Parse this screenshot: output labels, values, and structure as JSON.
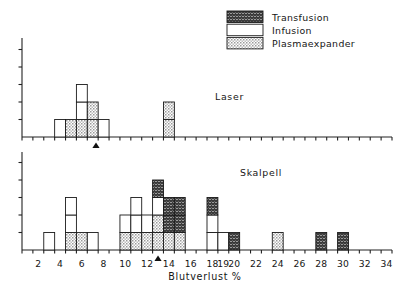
{
  "figure": {
    "xlabel": "Blutverlust %",
    "panels": [
      {
        "key": "laser",
        "label": "Laser"
      },
      {
        "key": "skalpell",
        "label": "Skalpell"
      }
    ]
  },
  "legend": {
    "position": "top-right",
    "items": [
      {
        "key": "transfusion",
        "label": "Transfusion",
        "fill": "#4a4a4a",
        "pattern": "dark-crosshatch"
      },
      {
        "key": "infusion",
        "label": "Infusion",
        "fill": "#ffffff",
        "pattern": "empty"
      },
      {
        "key": "plasmaexpander",
        "label": "Plasmaexpander",
        "fill": "#d8d8d8",
        "pattern": "light-stipple"
      }
    ]
  },
  "colors": {
    "transfusion": "#4a4a4a",
    "infusion": "#ffffff",
    "plasmaexpander": "#d8d8d8",
    "axis": "#222222",
    "outline": "#1a1a1a"
  },
  "axis": {
    "xlim": [
      1,
      35
    ],
    "xticks": [
      2,
      4,
      6,
      8,
      10,
      12,
      14,
      16,
      18,
      19,
      20,
      22,
      24,
      26,
      28,
      30,
      32,
      34
    ],
    "xtick_labels": [
      "2",
      "4",
      "6",
      "8",
      "10",
      "12",
      "14",
      "16",
      "18",
      "19",
      "20",
      "22",
      "24",
      "26",
      "28",
      "30",
      "32",
      "34"
    ],
    "xtick_minor_step": 1,
    "ylim_laser": [
      0,
      5
    ],
    "ylim_skalpell": [
      0,
      5
    ],
    "yticks_unlabeled": true,
    "grid": false
  },
  "chart_data": {
    "type": "bar",
    "title": "",
    "subtitle": "",
    "xlabel": "Blutverlust %",
    "ylabel": "",
    "xlim": [
      1,
      35
    ],
    "ylim": [
      0,
      5
    ],
    "grid": false,
    "legend_position": "top-right",
    "stacked": true,
    "bin_width": 1,
    "categories": [
      "Transfusion",
      "Infusion",
      "Plasmaexpander"
    ],
    "panels": [
      {
        "name": "Laser",
        "mean_marker": 7.8,
        "bins": [
          {
            "x": 4,
            "transfusion": 0,
            "infusion": 1,
            "plasmaexpander": 0
          },
          {
            "x": 5,
            "transfusion": 0,
            "infusion": 0,
            "plasmaexpander": 1
          },
          {
            "x": 6,
            "transfusion": 0,
            "infusion": 2,
            "plasmaexpander": 1
          },
          {
            "x": 7,
            "transfusion": 0,
            "infusion": 0,
            "plasmaexpander": 2
          },
          {
            "x": 8,
            "transfusion": 0,
            "infusion": 1,
            "plasmaexpander": 0
          },
          {
            "x": 14,
            "transfusion": 0,
            "infusion": 0,
            "plasmaexpander": 2
          }
        ]
      },
      {
        "name": "Skalpell",
        "mean_marker": 13.5,
        "bins": [
          {
            "x": 3,
            "transfusion": 0,
            "infusion": 1,
            "plasmaexpander": 0
          },
          {
            "x": 5,
            "transfusion": 0,
            "infusion": 2,
            "plasmaexpander": 1
          },
          {
            "x": 6,
            "transfusion": 0,
            "infusion": 0,
            "plasmaexpander": 1
          },
          {
            "x": 7,
            "transfusion": 0,
            "infusion": 1,
            "plasmaexpander": 0
          },
          {
            "x": 10,
            "transfusion": 0,
            "infusion": 1,
            "plasmaexpander": 1
          },
          {
            "x": 11,
            "transfusion": 0,
            "infusion": 2,
            "plasmaexpander": 1
          },
          {
            "x": 12,
            "transfusion": 0,
            "infusion": 1,
            "plasmaexpander": 1
          },
          {
            "x": 13,
            "transfusion": 1,
            "infusion": 1,
            "plasmaexpander": 2
          },
          {
            "x": 14,
            "transfusion": 2,
            "infusion": 0,
            "plasmaexpander": 1
          },
          {
            "x": 15,
            "transfusion": 2,
            "infusion": 0,
            "plasmaexpander": 1
          },
          {
            "x": 18,
            "transfusion": 1,
            "infusion": 2,
            "plasmaexpander": 0
          },
          {
            "x": 19,
            "transfusion": 0,
            "infusion": 1,
            "plasmaexpander": 0
          },
          {
            "x": 20,
            "transfusion": 1,
            "infusion": 0,
            "plasmaexpander": 0
          },
          {
            "x": 24,
            "transfusion": 0,
            "infusion": 0,
            "plasmaexpander": 1
          },
          {
            "x": 28,
            "transfusion": 1,
            "infusion": 0,
            "plasmaexpander": 0
          },
          {
            "x": 30,
            "transfusion": 1,
            "infusion": 0,
            "plasmaexpander": 0
          }
        ]
      }
    ]
  }
}
